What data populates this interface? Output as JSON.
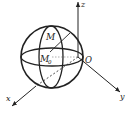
{
  "diagram": {
    "type": "3d-coordinate-sphere",
    "axes": {
      "x_label": "x",
      "y_label": "y",
      "z_label": "z",
      "origin_label": "O"
    },
    "points": {
      "M_label": "M",
      "M0_label": "M",
      "M0_subscript": "0"
    },
    "colors": {
      "stroke": "#222222",
      "background": "#ffffff"
    }
  }
}
